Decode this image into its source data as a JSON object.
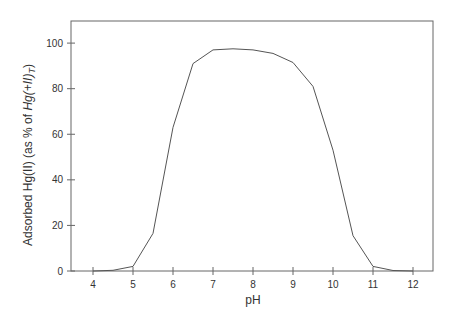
{
  "chart_data": {
    "type": "line",
    "title": "",
    "xlabel": "pH",
    "ylabel": "Adsorbed Hg(II) (as % of Hg(+II)T)",
    "ylabel_parts": {
      "prefix": "Adsorbed Hg(II) (as % of ",
      "italic": "Hg(+II)",
      "subscript": "T",
      "suffix": ")"
    },
    "xlim": [
      3.55,
      12.55
    ],
    "ylim": [
      0,
      109
    ],
    "xticks": [
      4,
      5,
      6,
      7,
      8,
      9,
      10,
      11,
      12
    ],
    "yticks": [
      0,
      20,
      40,
      60,
      80,
      100
    ],
    "grid": false,
    "legend": null,
    "series": [
      {
        "name": "Adsorbed Hg(II)",
        "color": "#555555",
        "x": [
          4,
          4.5,
          5,
          5.5,
          6,
          6.5,
          7,
          7.5,
          8,
          8.5,
          9,
          9.5,
          10,
          10.5,
          11,
          11.5,
          12
        ],
        "y": [
          0,
          0.3,
          2,
          16.5,
          63,
          91,
          97,
          97.5,
          97,
          95.5,
          91.5,
          81,
          53,
          15.5,
          2,
          0.2,
          0
        ]
      }
    ]
  }
}
